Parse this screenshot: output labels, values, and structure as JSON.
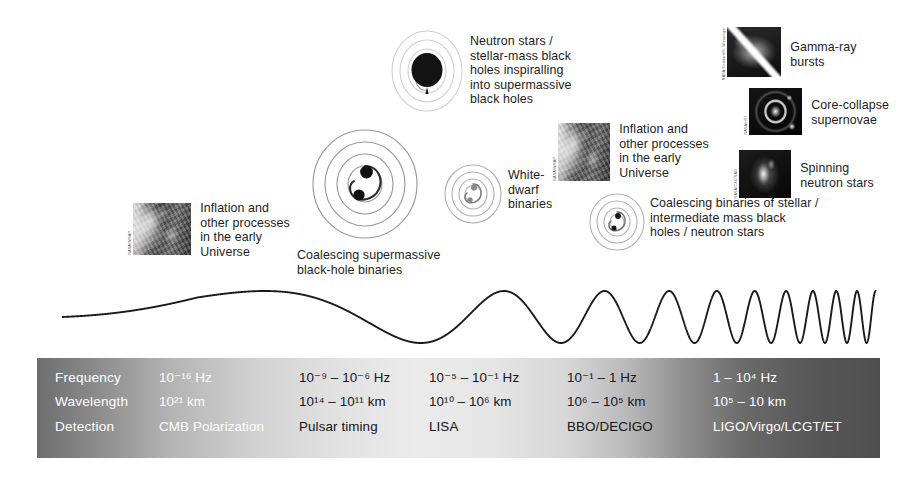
{
  "figure": {
    "kind": "gravitational-wave-spectrum",
    "background": "#ffffff",
    "wave_color": "#1a1a1a"
  },
  "annotations": [
    {
      "id": "cmb-left",
      "label": "Inflation and\nother processes\nin the early\nUniverse",
      "image": "cmb-map-thumbnail",
      "credit": "NASA/WMAP"
    },
    {
      "id": "smbh-binaries",
      "label": "Coalescing supermassive\nblack-hole binaries",
      "icon": "spiral-binary-icon"
    },
    {
      "id": "emri",
      "label": "Neutron stars /\nstellar-mass black\nholes inspiralling\ninto supermassive\nblack holes",
      "icon": "inspiral-black-hole-icon"
    },
    {
      "id": "white-dwarf-binaries",
      "label": "White-\ndwarf\nbinaries",
      "icon": "spiral-binary-icon"
    },
    {
      "id": "cmb-right",
      "label": "Inflation and\nother processes\nin the early\nUniverse",
      "image": "cmb-map-thumbnail",
      "credit": "NASA/WMAP"
    },
    {
      "id": "stellar-binaries",
      "label": "Coalescing binaries of stellar /\nintermediate mass black\nholes / neutron stars",
      "icon": "spiral-binary-icon"
    },
    {
      "id": "gamma-ray-bursts",
      "label": "Gamma-ray\nbursts",
      "image": "gamma-ray-burst-thumbnail",
      "credit": "NASA/Goddard/S. Wiessinger"
    },
    {
      "id": "core-collapse-supernovae",
      "label": "Core-collapse\nsupernovae",
      "image": "supernova-remnant-thumbnail",
      "credit": "NASA/HST"
    },
    {
      "id": "spinning-neutron-stars",
      "label": "Spinning\nneutron stars",
      "image": "pulsar-nebula-thumbnail",
      "credit": "NASA/CXC/SAO"
    }
  ],
  "table": {
    "row_labels": [
      "Frequency",
      "Wavelength",
      "Detection"
    ],
    "columns": [
      {
        "frequency": "10⁻¹⁶ Hz",
        "wavelength": "10²¹ km",
        "detection": "CMB Polarization"
      },
      {
        "frequency": "10⁻⁹ – 10⁻⁶ Hz",
        "wavelength": "10¹⁴ – 10¹¹ km",
        "detection": "Pulsar timing"
      },
      {
        "frequency": "10⁻⁵ – 10⁻¹ Hz",
        "wavelength": "10¹⁰ – 10⁶ km",
        "detection": "LISA"
      },
      {
        "frequency": "10⁻¹ – 1 Hz",
        "wavelength": "10⁶ – 10⁵ km",
        "detection": "BBO/DECIGO"
      },
      {
        "frequency": "1 – 10⁴ Hz",
        "wavelength": "10⁵ – 10 km",
        "detection": "LIGO/Virgo/LCGT/ET"
      }
    ]
  }
}
